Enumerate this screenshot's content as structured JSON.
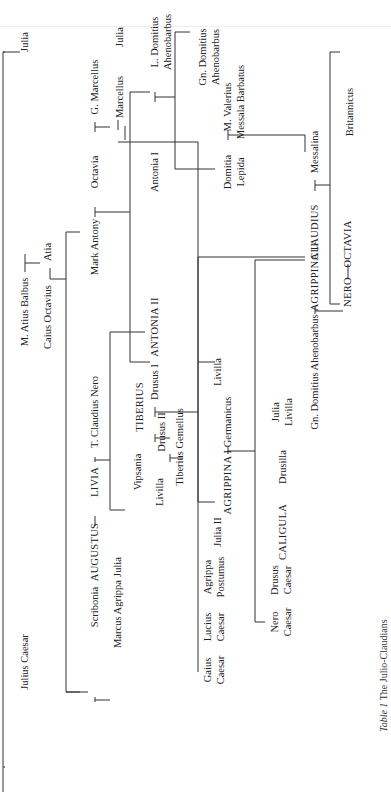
{
  "caption": {
    "label": "Table 1",
    "title": "The Julio-Claudians"
  },
  "people": {
    "julius_caesar": "Julius Caesar",
    "julia_sister": "Julia",
    "m_atius_balbus": "M. Atius Balbus",
    "atia": "Atia",
    "caius_octavius": "Caius Octavius",
    "scribonia": "Scribonia",
    "augustus": "AUGUSTUS",
    "livia": "LIVIA",
    "t_claudius_nero": "T. Claudius Nero",
    "mark_antony": "Mark Antony",
    "octavia": "Octavia",
    "g_marcellus": "G. Marcellus",
    "marcellus": "Marcellus",
    "julia_wife_marcellus": "Julia",
    "antonia_i": "Antonia I",
    "l_domitius": "L. Domitius",
    "ahenobarbus_1": "Ahenobarbus",
    "gn_domitius": "Gn. Domitius",
    "ahenobarbus_2": "Ahenobarbus",
    "domitia": "Domitia",
    "lepida": "Lepida",
    "m_valerius": "M. Valerius",
    "messala_barbatus": "Messala Barbatus",
    "messalina": "Messalina",
    "britannicus": "Britannicus",
    "antonia_ii": "ANTONIA II",
    "drusus_i": "Drusus I",
    "claudius": "CLAUDIUS",
    "livilla": "Livilla",
    "marcus_agrippa": "Marcus Agrippa",
    "julia_daughter": "Julia",
    "vipsania": "Vipsania",
    "tiberius": "TIBERIUS",
    "livilla_2": "Livilla",
    "drusus_ii": "Drusus II",
    "tiberius_gemellus": "Tiberius Gemellus",
    "gaius_caesar_1": "Gaius",
    "gaius_caesar_2": "Caesar",
    "lucius_caesar_1": "Lucius",
    "lucius_caesar_2": "Caesar",
    "agrippa_postumus_1": "Agrippa",
    "agrippa_postumus_2": "Postumus",
    "julia_ii": "Julia II",
    "agrippina_i": "AGRIPPINA I",
    "germanicus": "Germanicus",
    "nero_caesar_1": "Nero",
    "nero_caesar_2": "Caesar",
    "drusus_caesar_1": "Drusus",
    "drusus_caesar_2": "Caesar",
    "caligula": "CALIGULA",
    "drusilla": "Drusilla",
    "julia_livilla_1": "Julia",
    "julia_livilla_2": "Livilla",
    "gn_domitius_ahenobarbus": "Gn. Domitius Ahenobarbus",
    "agrippina_ii": "AGRIPPINA II",
    "nero": "NERO",
    "octavia_2": "OCTAVIA"
  }
}
